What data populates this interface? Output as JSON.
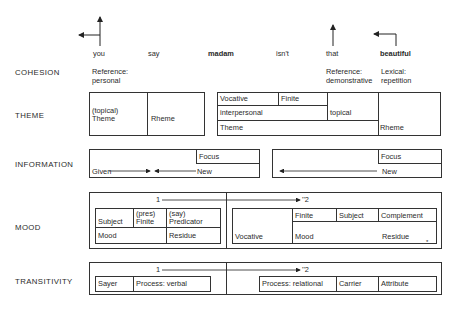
{
  "words": [
    {
      "text": "you",
      "bold": false
    },
    {
      "text": "say",
      "bold": false
    },
    {
      "text": "madam",
      "bold": true
    },
    {
      "text": "isn't",
      "bold": false
    },
    {
      "text": "that",
      "bold": false
    },
    {
      "text": "beautiful",
      "bold": true
    }
  ],
  "rows": {
    "cohesion": {
      "label": "COHESION",
      "items": [
        {
          "line1": "Reference:",
          "line2": "personal"
        },
        {
          "line1": "Reference:",
          "line2": "demonstrative"
        },
        {
          "line1": "Lexical:",
          "line2": "repetition"
        }
      ]
    },
    "theme": {
      "label": "THEME",
      "left": {
        "topical": "(topical)",
        "theme": "Theme",
        "rheme": "Rheme"
      },
      "right": {
        "vocative": "Vocative",
        "finite": "Finite",
        "interpersonal": "interpersonal",
        "topical": "topical",
        "theme": "Theme",
        "rheme": "Rheme"
      }
    },
    "information": {
      "label": "INFORMATION",
      "left": {
        "focus": "Focus",
        "given": "Given",
        "new": "New"
      },
      "right": {
        "focus": "Focus",
        "new": "New"
      }
    },
    "mood": {
      "label": "MOOD",
      "clause1_marker": "1",
      "clause2_marker": "''2",
      "left": {
        "subject": "Subject",
        "finite_note": "(pres)",
        "finite": "Finite",
        "predicator_note": "(say)",
        "predicator": "Predicator",
        "mood": "Mood",
        "residue": "Residue"
      },
      "right": {
        "vocative": "Vocative",
        "finite": "Finite",
        "subject": "Subject",
        "complement": "Complement",
        "mood": "Mood",
        "residue": "Residue",
        "footnote_mark": "*"
      }
    },
    "transitivity": {
      "label": "TRANSITIVITY",
      "clause1_marker": "1",
      "clause2_marker": "''2",
      "left": {
        "sayer": "Sayer",
        "process": "Process: verbal"
      },
      "right": {
        "process": "Process: relational",
        "carrier": "Carrier",
        "attribute": "Attribute"
      }
    }
  },
  "colors": {
    "line": "#333333",
    "text": "#2a2a2a",
    "background": "#ffffff"
  }
}
